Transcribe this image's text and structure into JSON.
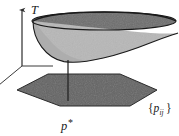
{
  "figure": {
    "kind": "3d-math-diagram",
    "background_color": "#ffffff",
    "ink_color": "#1a1a1a",
    "width": 179,
    "height": 136,
    "labels": {
      "vertical_axis": "T",
      "optimum_point": "p*",
      "feasible_set": "{p_ij}",
      "feasible_set_open_brace": "{",
      "feasible_set_symbol": "p",
      "feasible_set_subscript": "ij",
      "feasible_set_close_brace": "}",
      "optimum_symbol": "p",
      "optimum_star": "*"
    },
    "surface": {
      "name": "paraboloid-bowl",
      "outer_fill": "#b7b7b7",
      "rim_fill": "#6d6d6d",
      "stroke": "#1a1a1a",
      "rim_center_x": 104,
      "rim_center_y": 21,
      "rim_radius_x": 72,
      "rim_radius_y": 9,
      "apex_x": 68,
      "apex_y": 62,
      "tip_x": 178,
      "tip_y": 33
    },
    "base_region": {
      "name": "hexagonal-feasible-region",
      "fill": "#636363",
      "stroke": "#2b2b2b",
      "vertices": "17,90 48,74 120,74 157,90 130,106 60,106"
    },
    "axes": {
      "origin_x": 22,
      "origin_y": 66,
      "vertical_top_x": 22,
      "vertical_top_y": 7,
      "horizontal_end_x": 52,
      "horizontal_end_y": 66,
      "depth_end_x": 0,
      "depth_end_y": 84,
      "stroke": "#3a3a3a"
    },
    "drop_line": {
      "name": "optimum-drop-line",
      "x": 68,
      "y_top": 61,
      "y_bottom": 101,
      "stroke": "#1a1a1a"
    }
  }
}
